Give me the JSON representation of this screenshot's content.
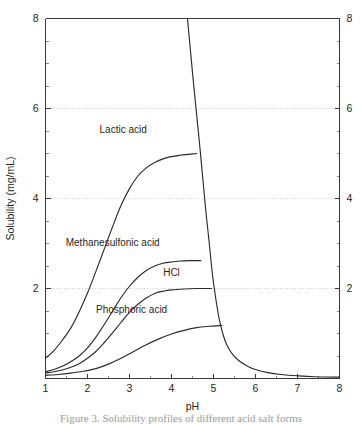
{
  "chart_data": {
    "type": "line",
    "title": "",
    "xlabel": "pH",
    "ylabel": "Solubility (mg/mL)",
    "xlim": [
      1,
      8
    ],
    "ylim": [
      0,
      8
    ],
    "xticks": [
      1,
      2,
      3,
      4,
      5,
      6,
      7,
      8
    ],
    "xtick_labels": [
      "1",
      "2",
      "3",
      "4",
      "5",
      "6",
      "7",
      "8"
    ],
    "yticks": [
      0,
      2,
      4,
      6,
      8
    ],
    "ytick_labels_left": [
      "",
      "2",
      "4",
      "6",
      "8"
    ],
    "ytick_labels_right": [
      "8",
      "2",
      "4",
      "6",
      "8"
    ],
    "minor_tick_step": 0.5,
    "grid": "horizontal-dotted-at-2-4-6",
    "legend_position": "inline-labels",
    "right_axis_mirror": true,
    "series": [
      {
        "name": "Lactic acid",
        "label": "Lactic acid",
        "label_x": 2.85,
        "label_y": 5.45,
        "plateau": 5.0,
        "points": [
          [
            1.0,
            0.45
          ],
          [
            1.2,
            0.62
          ],
          [
            1.4,
            0.85
          ],
          [
            1.6,
            1.12
          ],
          [
            1.8,
            1.48
          ],
          [
            2.0,
            1.9
          ],
          [
            2.2,
            2.38
          ],
          [
            2.4,
            2.88
          ],
          [
            2.6,
            3.38
          ],
          [
            2.8,
            3.85
          ],
          [
            3.0,
            4.22
          ],
          [
            3.2,
            4.5
          ],
          [
            3.4,
            4.68
          ],
          [
            3.6,
            4.8
          ],
          [
            3.8,
            4.88
          ],
          [
            4.0,
            4.93
          ],
          [
            4.2,
            4.96
          ],
          [
            4.4,
            4.98
          ],
          [
            4.6,
            5.0
          ]
        ]
      },
      {
        "name": "Methanesulfonic acid",
        "label": "Methanesulfonic acid",
        "label_x": 2.6,
        "label_y": 2.95,
        "plateau": 2.62,
        "points": [
          [
            1.0,
            0.15
          ],
          [
            1.2,
            0.2
          ],
          [
            1.4,
            0.27
          ],
          [
            1.6,
            0.37
          ],
          [
            1.8,
            0.5
          ],
          [
            2.0,
            0.68
          ],
          [
            2.2,
            0.92
          ],
          [
            2.4,
            1.2
          ],
          [
            2.6,
            1.5
          ],
          [
            2.8,
            1.8
          ],
          [
            3.0,
            2.05
          ],
          [
            3.2,
            2.25
          ],
          [
            3.4,
            2.4
          ],
          [
            3.6,
            2.5
          ],
          [
            3.8,
            2.56
          ],
          [
            4.0,
            2.59
          ],
          [
            4.2,
            2.61
          ],
          [
            4.4,
            2.62
          ],
          [
            4.7,
            2.62
          ]
        ]
      },
      {
        "name": "HCl",
        "label": "HCl",
        "label_x": 4.0,
        "label_y": 2.28,
        "plateau": 2.0,
        "points": [
          [
            1.0,
            0.12
          ],
          [
            1.2,
            0.15
          ],
          [
            1.4,
            0.19
          ],
          [
            1.6,
            0.25
          ],
          [
            1.8,
            0.33
          ],
          [
            2.0,
            0.45
          ],
          [
            2.2,
            0.6
          ],
          [
            2.4,
            0.8
          ],
          [
            2.6,
            1.02
          ],
          [
            2.8,
            1.25
          ],
          [
            3.0,
            1.47
          ],
          [
            3.2,
            1.65
          ],
          [
            3.4,
            1.79
          ],
          [
            3.6,
            1.89
          ],
          [
            3.8,
            1.94
          ],
          [
            4.0,
            1.97
          ],
          [
            4.3,
            1.99
          ],
          [
            4.6,
            2.0
          ],
          [
            4.95,
            2.0
          ]
        ]
      },
      {
        "name": "Phosphoric acid",
        "label": "Phosphoric acid",
        "label_x": 3.05,
        "label_y": 1.45,
        "plateau": 1.18,
        "points": [
          [
            1.0,
            0.07
          ],
          [
            1.3,
            0.09
          ],
          [
            1.6,
            0.12
          ],
          [
            1.9,
            0.16
          ],
          [
            2.2,
            0.22
          ],
          [
            2.5,
            0.32
          ],
          [
            2.8,
            0.45
          ],
          [
            3.1,
            0.6
          ],
          [
            3.4,
            0.75
          ],
          [
            3.7,
            0.88
          ],
          [
            4.0,
            0.99
          ],
          [
            4.3,
            1.07
          ],
          [
            4.6,
            1.13
          ],
          [
            4.9,
            1.16
          ],
          [
            5.2,
            1.18
          ]
        ]
      },
      {
        "name": "Descending limb",
        "label": "",
        "label_x": null,
        "label_y": null,
        "plateau": null,
        "points": [
          [
            4.38,
            8.0
          ],
          [
            4.45,
            7.3
          ],
          [
            4.52,
            6.6
          ],
          [
            4.6,
            5.85
          ],
          [
            4.68,
            5.1
          ],
          [
            4.75,
            4.4
          ],
          [
            4.82,
            3.7
          ],
          [
            4.9,
            3.0
          ],
          [
            4.97,
            2.35
          ],
          [
            5.05,
            1.8
          ],
          [
            5.13,
            1.35
          ],
          [
            5.22,
            1.0
          ],
          [
            5.32,
            0.74
          ],
          [
            5.45,
            0.54
          ],
          [
            5.6,
            0.4
          ],
          [
            5.8,
            0.28
          ],
          [
            6.0,
            0.2
          ],
          [
            6.3,
            0.13
          ],
          [
            6.6,
            0.09
          ],
          [
            7.0,
            0.06
          ],
          [
            7.4,
            0.04
          ],
          [
            8.0,
            0.03
          ]
        ]
      }
    ]
  },
  "caption": {
    "clipped_line": "Figure 3.  Solubility profiles of different acid salt forms"
  }
}
